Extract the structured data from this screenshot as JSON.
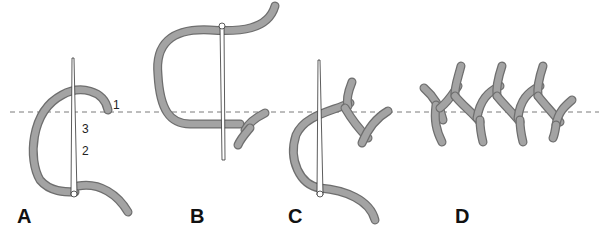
{
  "figure": {
    "steps": [
      {
        "label": "A"
      },
      {
        "label": "B"
      },
      {
        "label": "C"
      },
      {
        "label": "D"
      }
    ],
    "point_numbers": [
      "1",
      "2",
      "3"
    ],
    "colors": {
      "thread_fill": "#a3a3a3",
      "thread_outline": "#6e6e6e",
      "guide_line": "#7a7a7a",
      "background": "#ffffff"
    }
  }
}
